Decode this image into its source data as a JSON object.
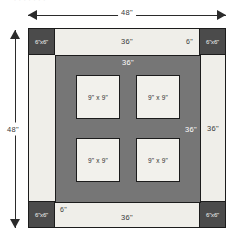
{
  "caption_fragment": "· · · · · · ·",
  "colors": {
    "outline": "#1c1c1c",
    "border_band": "#efeee9",
    "corner_tile": "#4b4b4b",
    "inner_field": "#767676",
    "block_fill": "#f2f1ec",
    "page_background": "#ffffff"
  },
  "dimensions": {
    "overall_width_label": "48\"",
    "overall_height_label": "48\"",
    "field_label": "36\"",
    "corner_label": "6\"x6\"",
    "strip_label": "6\"",
    "block_label": "9\" x 9\""
  },
  "plan": {
    "corners": [
      {
        "position": "top-left",
        "label": "6\"x6\""
      },
      {
        "position": "top-right",
        "label": "6\"x6\""
      },
      {
        "position": "bottom-left",
        "label": "6\"x6\""
      },
      {
        "position": "bottom-right",
        "label": "6\"x6\""
      }
    ],
    "border_strip_labels": {
      "top_center": "36\"",
      "top_right": "6\"",
      "bottom_center": "36\"",
      "bottom_left": "6\"",
      "right_center": "36\""
    },
    "field": {
      "top_label": "36\"",
      "right_label": "36\""
    },
    "blocks": [
      {
        "label": "9\" x 9\""
      },
      {
        "label": "9\" x 9\""
      },
      {
        "label": "9\" x 9\""
      },
      {
        "label": "9\" x 9\""
      }
    ]
  },
  "chart_data": {
    "type": "table",
    "xlabel": "",
    "ylabel": "",
    "categories": [
      "overall square",
      "corner tile",
      "border strip",
      "inner field",
      "center block"
    ],
    "values": [
      48,
      6,
      6,
      36,
      9
    ],
    "notes": [
      "Overall plan measures 48\" by 48\".",
      "Four dark corner tiles each 6\" x 6\".",
      "Cream border strips are 6\" wide; the run between corners is 36\".",
      "Inner gray field is 36\" x 36\".",
      "Four light blocks inside the field are each 9\" x 9\"."
    ]
  }
}
